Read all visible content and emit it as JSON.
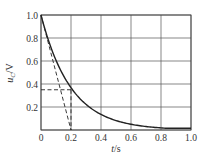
{
  "chart_data": {
    "type": "line",
    "title": "",
    "xlabel": "t/s",
    "ylabel": "u_C/V",
    "xlim": [
      0,
      1.0
    ],
    "ylim": [
      0,
      1.0
    ],
    "x_ticks": [
      "0",
      "0.2",
      "0.4",
      "0.6",
      "0.8",
      "1.0"
    ],
    "y_ticks": [
      "0.2",
      "0.4",
      "0.6",
      "0.8",
      "1.0"
    ],
    "grid": true,
    "legend": null,
    "series": [
      {
        "name": "u_C(t)",
        "style": "solid",
        "x": [
          0,
          0.05,
          0.1,
          0.15,
          0.2,
          0.3,
          0.4,
          0.5,
          0.6,
          0.7,
          0.8,
          0.9,
          1.0
        ],
        "values": [
          1.0,
          0.78,
          0.61,
          0.47,
          0.37,
          0.22,
          0.14,
          0.08,
          0.05,
          0.03,
          0.02,
          0.01,
          0.01
        ]
      },
      {
        "name": "tangent at t=0",
        "style": "dashed",
        "x": [
          0,
          0.2
        ],
        "values": [
          1.0,
          0
        ]
      },
      {
        "name": "time-constant level",
        "style": "dashed",
        "x": [
          0,
          0.2
        ],
        "values": [
          0.35,
          0.35
        ]
      },
      {
        "name": "time-constant drop",
        "style": "dashed",
        "x": [
          0.2,
          0.2
        ],
        "values": [
          0.35,
          0
        ]
      }
    ],
    "annotations": []
  },
  "labels": {
    "xlabel_main": "t",
    "xlabel_unit": "/s",
    "ylabel_main": "u",
    "ylabel_sub": "C",
    "ylabel_unit": "/V"
  }
}
